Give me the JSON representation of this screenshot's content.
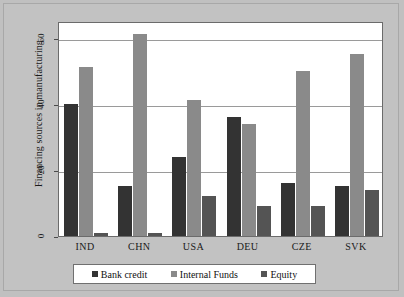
{
  "chart_data": {
    "type": "bar",
    "title": "",
    "xlabel": "",
    "ylabel": "Financing sources in manufacturing",
    "ylim": [
      0,
      65
    ],
    "yticks": [
      0,
      20,
      40,
      60
    ],
    "grid": true,
    "legend_position": "bottom",
    "categories": [
      "IND",
      "CHN",
      "USA",
      "DEU",
      "CZE",
      "SVK"
    ],
    "series": [
      {
        "name": "Bank credit",
        "color": "#333333",
        "values": [
          40,
          15,
          24,
          36,
          16,
          15
        ]
      },
      {
        "name": "Internal Funds",
        "color": "#8a8a8a",
        "values": [
          51,
          61,
          41,
          34,
          50,
          55
        ]
      },
      {
        "name": "Equity",
        "color": "#545454",
        "values": [
          1,
          1,
          12,
          9,
          9,
          14
        ]
      }
    ]
  }
}
